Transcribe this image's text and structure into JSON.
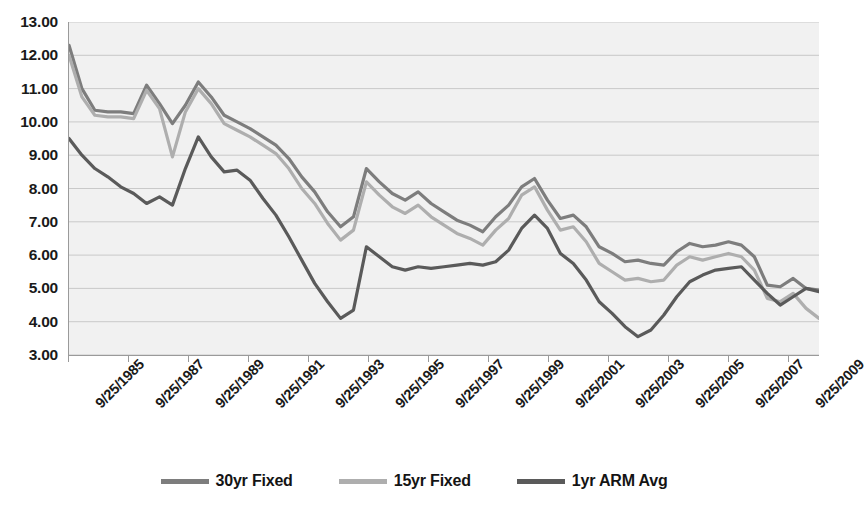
{
  "chart_data": {
    "type": "line",
    "title": "",
    "xlabel": "",
    "ylabel": "",
    "ylim": [
      3.0,
      13.0
    ],
    "ytick_step": 1.0,
    "grid": true,
    "legend_position": "bottom",
    "y_ticks": [
      "13.00",
      "12.00",
      "11.00",
      "10.00",
      "9.00",
      "8.00",
      "7.00",
      "6.00",
      "5.00",
      "4.00",
      "3.00"
    ],
    "x_ticks": [
      "9/25/1985",
      "9/25/1987",
      "9/25/1989",
      "9/25/1991",
      "9/25/1993",
      "9/25/1995",
      "9/25/1997",
      "9/25/1999",
      "9/25/2001",
      "9/25/2003",
      "9/25/2005",
      "9/25/2007",
      "9/25/2009"
    ],
    "x_tick_year_start": 1985,
    "x_tick_year_step": 2,
    "x_data_start_year": 1985,
    "x_data_end_year": 2010,
    "x_points_per_year": 2,
    "series": [
      {
        "name": "30yr Fixed",
        "color": "#7d7d7d",
        "values": [
          12.3,
          11.0,
          10.35,
          10.3,
          10.3,
          10.25,
          11.1,
          10.55,
          9.95,
          10.5,
          11.2,
          10.75,
          10.2,
          10.0,
          9.8,
          9.55,
          9.3,
          8.9,
          8.35,
          7.9,
          7.3,
          6.85,
          7.15,
          8.6,
          8.2,
          7.85,
          7.65,
          7.9,
          7.55,
          7.3,
          7.05,
          6.9,
          6.7,
          7.15,
          7.5,
          8.05,
          8.3,
          7.65,
          7.1,
          7.2,
          6.85,
          6.25,
          6.05,
          5.8,
          5.85,
          5.75,
          5.7,
          6.1,
          6.35,
          6.25,
          6.3,
          6.4,
          6.3,
          5.95,
          5.1,
          5.05,
          5.3,
          5.0,
          4.95
        ]
      },
      {
        "name": "15yr Fixed",
        "color": "#aeaeae",
        "values": [
          12.0,
          10.75,
          10.2,
          10.15,
          10.15,
          10.1,
          10.95,
          10.4,
          8.95,
          10.3,
          11.0,
          10.55,
          9.95,
          9.75,
          9.55,
          9.3,
          9.05,
          8.6,
          8.0,
          7.55,
          6.95,
          6.45,
          6.75,
          8.2,
          7.8,
          7.45,
          7.25,
          7.5,
          7.15,
          6.9,
          6.65,
          6.5,
          6.3,
          6.75,
          7.1,
          7.8,
          8.05,
          7.35,
          6.75,
          6.85,
          6.4,
          5.75,
          5.5,
          5.25,
          5.3,
          5.2,
          5.25,
          5.7,
          5.95,
          5.85,
          5.95,
          6.05,
          5.95,
          5.55,
          4.7,
          4.6,
          4.85,
          4.4,
          4.1
        ]
      },
      {
        "name": "1yr ARM Avg",
        "color": "#5a5a5a",
        "values": [
          9.5,
          9.0,
          8.6,
          8.35,
          8.05,
          7.85,
          7.55,
          7.75,
          7.5,
          8.6,
          9.55,
          8.95,
          8.5,
          8.55,
          8.25,
          7.7,
          7.2,
          6.55,
          5.85,
          5.15,
          4.6,
          4.1,
          4.35,
          6.25,
          5.95,
          5.65,
          5.55,
          5.65,
          5.6,
          5.65,
          5.7,
          5.75,
          5.7,
          5.8,
          6.15,
          6.8,
          7.2,
          6.8,
          6.05,
          5.75,
          5.25,
          4.6,
          4.25,
          3.85,
          3.55,
          3.75,
          4.2,
          4.75,
          5.2,
          5.4,
          5.55,
          5.6,
          5.65,
          5.25,
          4.85,
          4.5,
          4.75,
          5.0,
          4.9
        ]
      }
    ]
  },
  "legend": {
    "items": [
      {
        "label": "30yr Fixed",
        "color": "#7d7d7d"
      },
      {
        "label": "15yr Fixed",
        "color": "#aeaeae"
      },
      {
        "label": "1yr ARM Avg",
        "color": "#5a5a5a"
      }
    ]
  },
  "colors": {
    "plot_background": "#f1f1f1",
    "gridline": "#c9c9c9",
    "axis": "#9a9a9a",
    "text": "#1a1a1a"
  }
}
